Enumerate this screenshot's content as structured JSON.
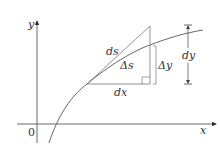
{
  "diagram": {
    "axes": {
      "x_label": "x",
      "y_label": "y",
      "origin_label": "0"
    },
    "labels": {
      "ds": "ds",
      "delta_s": "Δs",
      "delta_y": "Δy",
      "dx": "dx",
      "dy": "dy"
    },
    "colors": {
      "line": "#555555",
      "text": "#333333"
    }
  }
}
